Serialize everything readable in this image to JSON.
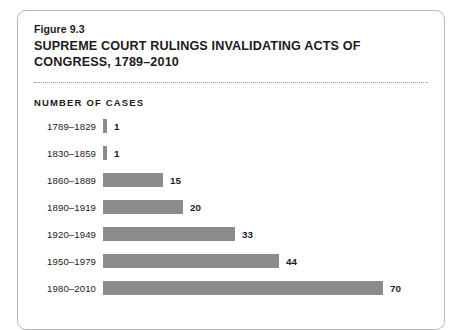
{
  "figure": {
    "number": "Figure 9.3",
    "title": "SUPREME COURT RULINGS INVALIDATING ACTS OF CONGRESS, 1789–2010",
    "axis_caption": "NUMBER OF CASES"
  },
  "style": {
    "bar_color": "#8c8c8c",
    "text_color": "#1b1b1b",
    "card_border_color": "#b9b9b9",
    "divider_color": "#9a9a9a"
  },
  "chart_data": {
    "type": "bar",
    "orientation": "horizontal",
    "title": "SUPREME COURT RULINGS INVALIDATING ACTS OF CONGRESS, 1789–2010",
    "subtitle": "Figure 9.3",
    "xlabel": "NUMBER OF CASES",
    "ylabel": "",
    "grid": false,
    "legend": false,
    "xlim": [
      0,
      70
    ],
    "categories": [
      "1789–1829",
      "1830–1859",
      "1860–1889",
      "1890–1919",
      "1920–1949",
      "1950–1979",
      "1980–2010"
    ],
    "values": [
      1,
      1,
      15,
      20,
      33,
      44,
      70
    ],
    "bars": [
      {
        "category": "1789–1829",
        "value": 1,
        "label": "1"
      },
      {
        "category": "1830–1859",
        "value": 1,
        "label": "1"
      },
      {
        "category": "1860–1889",
        "value": 15,
        "label": "15"
      },
      {
        "category": "1890–1919",
        "value": 20,
        "label": "20"
      },
      {
        "category": "1920–1949",
        "value": 33,
        "label": "33"
      },
      {
        "category": "1950–1979",
        "value": 44,
        "label": "44"
      },
      {
        "category": "1980–2010",
        "value": 70,
        "label": "70"
      }
    ]
  }
}
